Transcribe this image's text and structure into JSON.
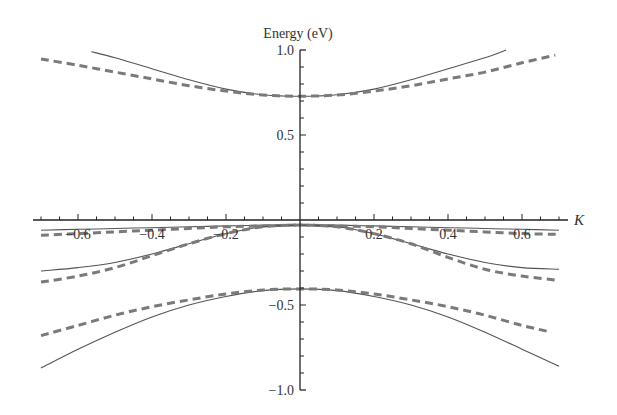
{
  "chart_data": {
    "type": "line",
    "title": "",
    "xlabel": "K",
    "ylabel": "Energy (eV)",
    "xlim": [
      -0.72,
      0.72
    ],
    "ylim": [
      -1.0,
      1.0
    ],
    "x_ticks": [
      -0.6,
      -0.4,
      -0.2,
      0.2,
      0.4,
      0.6
    ],
    "x_tick_labels": [
      "−0.6",
      "−0.4",
      "−0.2",
      "0.2",
      "0.4",
      "0.6"
    ],
    "y_ticks": [
      1.0,
      0.5,
      -0.5,
      -1.0
    ],
    "y_tick_labels": [
      "1.0",
      "0.5",
      "−0.5",
      "−1.0"
    ],
    "x_minor_step": 0.05,
    "y_minor_step": 0.1,
    "grid": false,
    "legend": "none",
    "series_color": "#555555",
    "dashed_color": "#7a7a7a",
    "series": [
      {
        "name": "band-1-solid",
        "style": "solid",
        "x": [
          -0.564,
          -0.5,
          -0.4,
          -0.3,
          -0.2,
          -0.1,
          0.0,
          0.1,
          0.2,
          0.3,
          0.4,
          0.5,
          0.557
        ],
        "y": [
          0.99,
          0.955,
          0.89,
          0.825,
          0.77,
          0.737,
          0.728,
          0.737,
          0.77,
          0.825,
          0.89,
          0.955,
          1.0
        ]
      },
      {
        "name": "band-1-dashed",
        "style": "dashed",
        "x": [
          -0.7,
          -0.6,
          -0.5,
          -0.4,
          -0.3,
          -0.2,
          -0.1,
          0.0,
          0.1,
          0.2,
          0.3,
          0.4,
          0.5,
          0.6,
          0.69
        ],
        "y": [
          0.947,
          0.91,
          0.87,
          0.83,
          0.79,
          0.758,
          0.735,
          0.728,
          0.735,
          0.758,
          0.79,
          0.83,
          0.87,
          0.925,
          0.97
        ]
      },
      {
        "name": "band-2-solid",
        "style": "solid",
        "x": [
          -0.7,
          -0.6,
          -0.5,
          -0.4,
          -0.3,
          -0.2,
          -0.1,
          0.0,
          0.1,
          0.2,
          0.3,
          0.4,
          0.5,
          0.6,
          0.7
        ],
        "y": [
          -0.06,
          -0.055,
          -0.05,
          -0.045,
          -0.04,
          -0.035,
          -0.03,
          -0.03,
          -0.03,
          -0.035,
          -0.04,
          -0.045,
          -0.05,
          -0.055,
          -0.06
        ]
      },
      {
        "name": "band-2-dashed",
        "style": "dashed",
        "x": [
          -0.7,
          -0.6,
          -0.5,
          -0.4,
          -0.3,
          -0.2,
          -0.1,
          0.0,
          0.1,
          0.2,
          0.3,
          0.4,
          0.5,
          0.6,
          0.7
        ],
        "y": [
          -0.09,
          -0.08,
          -0.07,
          -0.06,
          -0.05,
          -0.04,
          -0.035,
          -0.03,
          -0.035,
          -0.04,
          -0.05,
          -0.06,
          -0.07,
          -0.08,
          -0.085
        ]
      },
      {
        "name": "band-3-solid",
        "style": "solid",
        "x": [
          -0.7,
          -0.6,
          -0.5,
          -0.4,
          -0.3,
          -0.2,
          -0.1,
          0.0,
          0.1,
          0.2,
          0.3,
          0.4,
          0.5,
          0.6,
          0.7
        ],
        "y": [
          -0.3,
          -0.28,
          -0.25,
          -0.2,
          -0.14,
          -0.08,
          -0.04,
          -0.03,
          -0.04,
          -0.08,
          -0.14,
          -0.2,
          -0.25,
          -0.28,
          -0.29
        ]
      },
      {
        "name": "band-3-dashed",
        "style": "dashed",
        "x": [
          -0.7,
          -0.6,
          -0.5,
          -0.4,
          -0.3,
          -0.2,
          -0.1,
          0.0,
          0.1,
          0.2,
          0.3,
          0.4,
          0.5,
          0.6,
          0.7
        ],
        "y": [
          -0.365,
          -0.33,
          -0.28,
          -0.21,
          -0.14,
          -0.08,
          -0.04,
          -0.03,
          -0.04,
          -0.08,
          -0.14,
          -0.22,
          -0.29,
          -0.33,
          -0.355
        ]
      },
      {
        "name": "band-4-solid",
        "style": "solid",
        "x": [
          -0.7,
          -0.6,
          -0.5,
          -0.4,
          -0.3,
          -0.2,
          -0.1,
          0.0,
          0.1,
          0.2,
          0.3,
          0.4,
          0.5,
          0.6,
          0.7
        ],
        "y": [
          -0.87,
          -0.76,
          -0.66,
          -0.57,
          -0.5,
          -0.45,
          -0.415,
          -0.405,
          -0.415,
          -0.45,
          -0.5,
          -0.57,
          -0.66,
          -0.76,
          -0.86
        ]
      },
      {
        "name": "band-4-dashed",
        "style": "dashed",
        "x": [
          -0.7,
          -0.6,
          -0.5,
          -0.4,
          -0.3,
          -0.2,
          -0.1,
          0.0,
          0.1,
          0.2,
          0.3,
          0.4,
          0.5,
          0.6,
          0.68
        ],
        "y": [
          -0.68,
          -0.62,
          -0.56,
          -0.51,
          -0.47,
          -0.435,
          -0.412,
          -0.405,
          -0.412,
          -0.435,
          -0.47,
          -0.51,
          -0.56,
          -0.62,
          -0.66
        ]
      }
    ]
  }
}
